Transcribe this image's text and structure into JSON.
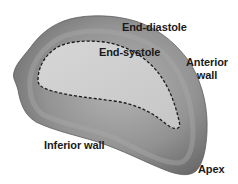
{
  "diagram": {
    "colors": {
      "background": "#ffffff",
      "wall_fill": "#8c8c8c",
      "wall_highlight": "#a8a8a8",
      "wall_shadow": "#6e6e6e",
      "cavity_fill": "#cfcfcf",
      "dashed_outline": "#1a1a1a",
      "label_text": "#1a1a1a"
    },
    "shapes": [
      {
        "name": "end-diastole-outline",
        "style": "solid-shaded-wall"
      },
      {
        "name": "end-systole-outline",
        "style": "dashed-black"
      }
    ],
    "labels": {
      "end_diastole": "End-diastole",
      "end_systole": "End-systole",
      "anterior_wall_line1": "Anterior",
      "anterior_wall_line2": "wall",
      "inferior_wall": "Inferior wall",
      "apex": "Apex"
    }
  }
}
